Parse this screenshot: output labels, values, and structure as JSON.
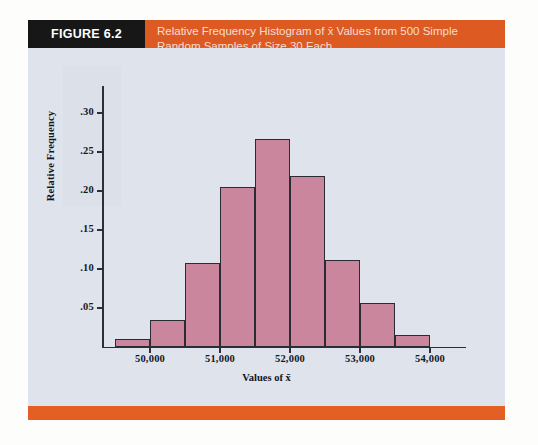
{
  "figure": {
    "label": "FIGURE 6.2",
    "title_line1": "Relative Frequency Histogram of x̄ Values from 500 Simple",
    "title_line2": "Random Samples of Size 30 Each",
    "title_full": "Relative Frequency Histogram of x̄ Values from 500 Simple Random Samples of Size 30 Each"
  },
  "colors": {
    "header_orange": "#dd5b23",
    "footer_orange": "#e45f23",
    "label_black": "#171717",
    "panel_background": "#dee3ec",
    "bar_fill": "#c9869d",
    "bar_border": "#2b2b33",
    "axis": "#2e2e33",
    "title_text": "#f6ded2"
  },
  "chart_data": {
    "type": "bar",
    "title": "Relative Frequency Histogram of x̄ Values from 500 Simple Random Samples of Size 30 Each",
    "xlabel": "Values of x̄",
    "ylabel": "Relative Frequency",
    "grid": false,
    "legend": "none",
    "xlim": [
      49500,
      54500
    ],
    "ylim": [
      0,
      0.335
    ],
    "xticks": [
      50000,
      51000,
      52000,
      53000,
      54000
    ],
    "xtick_labels": [
      "50,000",
      "51,000",
      "52,000",
      "53,000",
      "54,000"
    ],
    "yticks": [
      0.05,
      0.1,
      0.15,
      0.2,
      0.25,
      0.3
    ],
    "ytick_labels": [
      ".05",
      ".10",
      ".15",
      ".20",
      ".25",
      ".30"
    ],
    "bin_width": 500,
    "bin_edges": [
      49500,
      50000,
      50500,
      51000,
      51500,
      52000,
      52500,
      53000,
      53500,
      54000
    ],
    "categories": [
      "49,500-50,000",
      "50,000-50,500",
      "50,500-51,000",
      "51,000-51,500",
      "51,500-52,000",
      "52,000-52,500",
      "52,500-53,000",
      "53,000-53,500",
      "53,500-54,000"
    ],
    "values": [
      0.01,
      0.034,
      0.108,
      0.205,
      0.267,
      0.219,
      0.111,
      0.057,
      0.015
    ]
  }
}
